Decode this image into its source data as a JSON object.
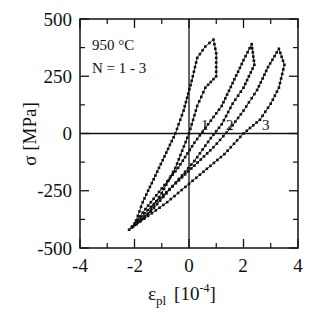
{
  "chart_data": {
    "type": "line",
    "title": "",
    "xlabel": "ε_pl [10^-4]",
    "ylabel": "σ [MPa]",
    "xlim": [
      -4,
      4
    ],
    "ylim": [
      -500,
      500
    ],
    "x_ticks": [
      -4,
      -2,
      0,
      2,
      4
    ],
    "y_ticks": [
      500,
      250,
      0,
      -250,
      -500
    ],
    "x_minor_ticks": [
      -3,
      -1,
      1,
      3
    ],
    "y_minor_ticks": [
      375,
      125,
      -125,
      -375
    ],
    "grid": false,
    "zero_lines": true,
    "annotations": [
      "950 °C",
      "N = 1 - 3",
      "1",
      "2",
      "3"
    ],
    "marker": "square",
    "series": [
      {
        "name": "1",
        "x": [
          -2.0,
          -1.7,
          -1.3,
          -0.9,
          -0.5,
          -0.2,
          0.1,
          0.3,
          0.6,
          0.9,
          1.0,
          1.0,
          0.6,
          0.3,
          0.0,
          -0.5,
          -1.0,
          -1.5,
          -2.0
        ],
        "y": [
          -400,
          -300,
          -200,
          -100,
          0,
          100,
          230,
          330,
          380,
          410,
          350,
          250,
          200,
          120,
          0,
          -150,
          -260,
          -350,
          -400
        ]
      },
      {
        "name": "2",
        "x": [
          -2.1,
          -1.6,
          -1.0,
          -0.4,
          0.2,
          0.7,
          1.2,
          1.6,
          2.0,
          2.3,
          2.4,
          2.0,
          1.6,
          1.2,
          0.8,
          0.2,
          -0.6,
          -1.4,
          -2.1
        ],
        "y": [
          -410,
          -330,
          -240,
          -150,
          -40,
          40,
          120,
          220,
          320,
          390,
          300,
          200,
          130,
          40,
          -20,
          -120,
          -230,
          -340,
          -410
        ]
      },
      {
        "name": "3",
        "x": [
          -2.2,
          -1.4,
          -0.6,
          0.2,
          0.9,
          1.5,
          2.0,
          2.5,
          2.9,
          3.3,
          3.5,
          3.3,
          3.0,
          2.6,
          2.0,
          1.3,
          0.4,
          -0.8,
          -2.2
        ],
        "y": [
          -420,
          -320,
          -230,
          -140,
          -60,
          20,
          100,
          190,
          290,
          370,
          300,
          200,
          130,
          60,
          0,
          -90,
          -180,
          -300,
          -420
        ]
      }
    ]
  },
  "labels": {
    "temperature": "950 °C",
    "cycles": "N = 1 - 3",
    "curve_1": "1",
    "curve_2": "2",
    "curve_3": "3",
    "x_title_main": "ε",
    "x_title_sub": "pl",
    "x_title_unit": "[10",
    "x_title_exp": "-4",
    "x_title_close": "]",
    "y_title": "σ  [MPa]",
    "x_tick_labels": [
      "-4",
      "-2",
      "0",
      "2",
      "4"
    ],
    "y_tick_labels": [
      "500",
      "250",
      "0",
      "-250",
      "-500"
    ]
  }
}
